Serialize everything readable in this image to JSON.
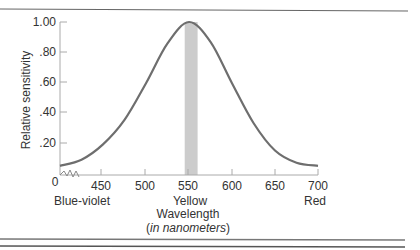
{
  "chart_data": {
    "type": "line",
    "title": "",
    "xlabel": "Wavelength",
    "xlabel_sub_prefix": "(",
    "xlabel_sub_italic": "in nanometers",
    "xlabel_sub_suffix": ")",
    "ylabel": "Relative sensitivity",
    "x_ticks": [
      "450",
      "500",
      "550",
      "600",
      "650",
      "700"
    ],
    "x_origin_label": "0",
    "y_ticks": [
      "1.00",
      ".80",
      ".60",
      ".40",
      ".20"
    ],
    "xlim": [
      400,
      700
    ],
    "ylim": [
      0,
      1.0
    ],
    "grid": false,
    "color_labels": [
      {
        "label": "Blue-violet",
        "at": 420
      },
      {
        "label": "Yellow",
        "at": 550
      },
      {
        "label": "Red",
        "at": 700
      }
    ],
    "highlight_band": {
      "from": 545,
      "to": 560,
      "color": "#cccccc"
    },
    "series": [
      {
        "name": "Relative sensitivity",
        "x": [
          400,
          425,
          450,
          475,
          500,
          525,
          550,
          575,
          600,
          625,
          650,
          675,
          700
        ],
        "values": [
          0.06,
          0.1,
          0.2,
          0.36,
          0.6,
          0.86,
          1.0,
          0.87,
          0.6,
          0.34,
          0.16,
          0.08,
          0.06
        ]
      }
    ]
  }
}
